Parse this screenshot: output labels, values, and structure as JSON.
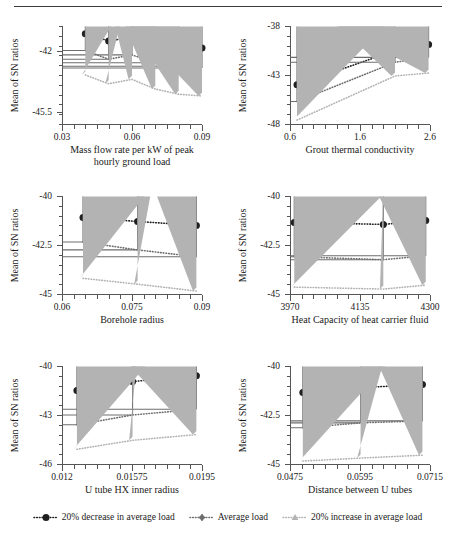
{
  "figure": {
    "y_axis_title": "Mean of SN ratios",
    "legend": [
      {
        "label": "20% decrease in average load",
        "marker": "circle",
        "color": "#1f1f1f"
      },
      {
        "label": "Average load",
        "marker": "diamond",
        "color": "#6e6e6e"
      },
      {
        "label": "20% increase in average load",
        "marker": "triangle",
        "color": "#b3b3b3"
      }
    ]
  },
  "chart_data": [
    {
      "type": "line",
      "title": "",
      "xlabel": "Mass flow rate per kW of peak hourly ground load",
      "ylabel": "Mean of SN ratios",
      "xticks": [
        "0.03",
        "0.06",
        "0.09"
      ],
      "xlim": [
        0.03,
        0.09
      ],
      "yticks": [
        "-45.5",
        "-42"
      ],
      "ylim": [
        -46.2,
        -40.6
      ],
      "x": [
        0.04,
        0.05,
        0.06,
        0.07,
        0.08,
        0.09
      ],
      "series": [
        {
          "name": "20% decrease in average load",
          "values": [
            -41.05,
            -41.45,
            -41.25,
            -41.6,
            -41.8,
            -41.85
          ]
        },
        {
          "name": "Average load",
          "values": [
            -42.0,
            -42.5,
            -42.25,
            -42.7,
            -42.9,
            -43.0
          ]
        },
        {
          "name": "20% increase in average load",
          "values": [
            -43.4,
            -43.9,
            -43.65,
            -44.2,
            -44.5,
            -44.6
          ]
        }
      ]
    },
    {
      "type": "line",
      "title": "",
      "xlabel": "Grout thermal conductivity",
      "ylabel": "Mean of SN ratios",
      "xticks": [
        "0.6",
        "1.6",
        "2.6"
      ],
      "xlim": [
        0.6,
        2.6
      ],
      "yticks": [
        "-48",
        "-43",
        "-38"
      ],
      "ylim": [
        -48,
        -38
      ],
      "x": [
        0.7,
        2.1,
        2.58
      ],
      "series": [
        {
          "name": "20% decrease in average load",
          "values": [
            -44.0,
            -40.5,
            -39.9
          ]
        },
        {
          "name": "Average load",
          "values": [
            -45.7,
            -41.7,
            -41.2
          ]
        },
        {
          "name": "20% increase in average load",
          "values": [
            -47.6,
            -43.1,
            -42.8
          ]
        }
      ]
    },
    {
      "type": "line",
      "title": "",
      "xlabel": "Borehole radius",
      "ylabel": "Mean of SN ratios",
      "xticks": [
        "0.06",
        "0.075",
        "0.09"
      ],
      "xlim": [
        0.06,
        0.09
      ],
      "yticks": [
        "-45",
        "-42.5",
        "-40"
      ],
      "ylim": [
        -45,
        -40
      ],
      "x": [
        0.0645,
        0.0762,
        0.0888
      ],
      "series": [
        {
          "name": "20% decrease in average load",
          "values": [
            -41.1,
            -41.3,
            -41.5
          ]
        },
        {
          "name": "Average load",
          "values": [
            -42.35,
            -42.75,
            -43.1
          ]
        },
        {
          "name": "20% increase in average load",
          "values": [
            -44.2,
            -44.5,
            -44.85
          ]
        }
      ]
    },
    {
      "type": "line",
      "title": "",
      "xlabel": "Heat Capacity of heat carrier fluid",
      "ylabel": "Mean of SN ratios",
      "xticks": [
        "3970",
        "4135",
        "4300"
      ],
      "xlim": [
        3970,
        4300
      ],
      "yticks": [
        "-45",
        "-42.5",
        "-40"
      ],
      "ylim": [
        -45,
        -40
      ],
      "x": [
        3980,
        4190,
        4290
      ],
      "series": [
        {
          "name": "20% decrease in average load",
          "values": [
            -41.35,
            -41.45,
            -41.25
          ]
        },
        {
          "name": "Average load",
          "values": [
            -43.1,
            -43.25,
            -43.05
          ]
        },
        {
          "name": "20% increase in average load",
          "values": [
            -44.65,
            -44.75,
            -44.55
          ]
        }
      ]
    },
    {
      "type": "line",
      "title": "",
      "xlabel": "U tube HX inner radius",
      "ylabel": "Mean of SN ratios",
      "xticks": [
        "0.012",
        "0.01575",
        "0.0195"
      ],
      "xlim": [
        0.012,
        0.0195
      ],
      "yticks": [
        "-46",
        "-43",
        "-40"
      ],
      "ylim": [
        -46,
        -40
      ],
      "x": [
        0.0128,
        0.01578,
        0.0192
      ],
      "series": [
        {
          "name": "20% decrease in average load",
          "values": [
            -41.5,
            -40.95,
            -40.6
          ]
        },
        {
          "name": "Average load",
          "values": [
            -43.6,
            -43.0,
            -42.65
          ]
        },
        {
          "name": "20% increase in average load",
          "values": [
            -45.1,
            -44.55,
            -44.2
          ]
        }
      ]
    },
    {
      "type": "line",
      "title": "",
      "xlabel": "Distance between U tubes",
      "ylabel": "Mean of SN ratios",
      "xticks": [
        "0.0475",
        "0.0595",
        "0.0715"
      ],
      "xlim": [
        0.0475,
        0.0715
      ],
      "yticks": [
        "-45",
        "-42.5",
        "-40"
      ],
      "ylim": [
        -45,
        -40
      ],
      "x": [
        0.0497,
        0.0596,
        0.0702
      ],
      "series": [
        {
          "name": "20% decrease in average load",
          "values": [
            -41.35,
            -41.1,
            -40.95
          ]
        },
        {
          "name": "Average load",
          "values": [
            -43.15,
            -42.9,
            -42.8
          ]
        },
        {
          "name": "20% increase in average load",
          "values": [
            -44.85,
            -44.7,
            -44.55
          ]
        }
      ]
    }
  ]
}
